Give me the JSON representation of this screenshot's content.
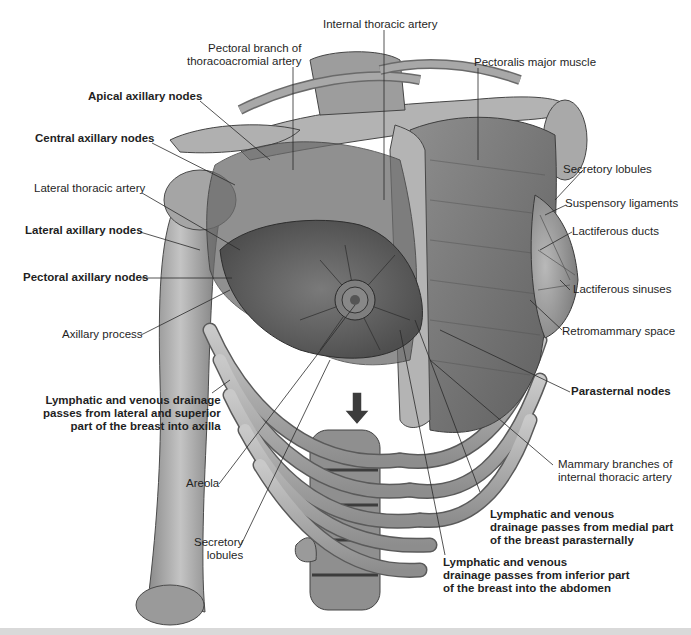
{
  "figure": {
    "colors": {
      "background": "#ffffff",
      "bone": "#a9a9a9",
      "bone_shadow": "#6e6e6e",
      "muscle": "#7a7a7a",
      "breast_tissue": "#5e5e5e",
      "leader_line": "#2a2a2a",
      "footer_bar": "#d9d9d9"
    }
  },
  "labels": {
    "internal_thoracic_artery": "Internal thoracic artery",
    "pectoral_branch": "Pectoral branch of\nthoracoacromial artery",
    "pectoralis_major": "Pectoralis major muscle",
    "apical_axillary_nodes": "Apical axillary nodes",
    "central_axillary_nodes": "Central axillary nodes",
    "lateral_thoracic_artery": "Lateral thoracic artery",
    "lateral_axillary_nodes": "Lateral axillary nodes",
    "pectoral_axillary_nodes": "Pectoral axillary nodes",
    "axillary_process": "Axillary process",
    "drainage_lateral": "Lymphatic and venous drainage\npasses from lateral and superior\npart of the breast into axilla",
    "areola": "Areola",
    "secretory_lobules_bottom": "Secretory\nlobules",
    "secretory_lobules_right": "Secretory lobules",
    "suspensory_ligaments": "Suspensory ligaments",
    "lactiferous_ducts": "Lactiferous ducts",
    "lactiferous_sinuses": "Lactiferous sinuses",
    "retromammary_space": "Retromammary space",
    "parasternal_nodes": "Parasternal nodes",
    "mammary_branches": "Mammary branches of\ninternal thoracic artery",
    "drainage_medial": "Lymphatic and venous\ndrainage passes from medial part\nof the breast parasternally",
    "drainage_inferior": "Lymphatic and venous\ndrainage passes from inferior part\nof the breast into the abdomen"
  },
  "icons": {
    "drainage_arrow": "down-arrow-icon"
  }
}
